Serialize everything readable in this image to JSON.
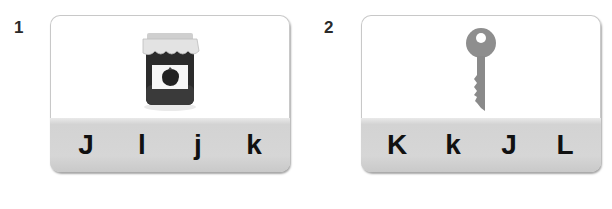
{
  "questions": [
    {
      "number": "1",
      "picture": "jam-jar-icon",
      "options": [
        "J",
        "l",
        "j",
        "k"
      ]
    },
    {
      "number": "2",
      "picture": "key-icon",
      "options": [
        "K",
        "k",
        "J",
        "L"
      ]
    }
  ]
}
